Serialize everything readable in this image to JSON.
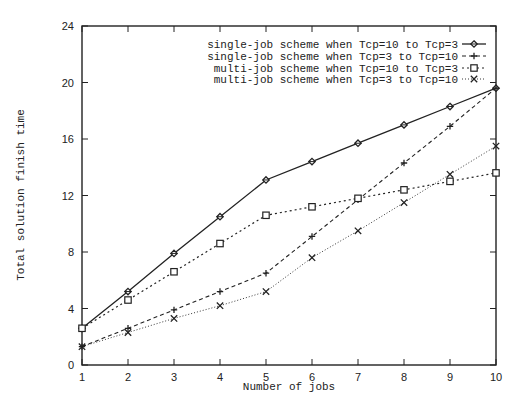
{
  "chart_data": {
    "type": "line",
    "title": "",
    "xlabel": "Number of jobs",
    "ylabel": "Total solution finish time",
    "x": [
      1,
      2,
      3,
      4,
      5,
      6,
      7,
      8,
      9,
      10
    ],
    "xlim": [
      1,
      10
    ],
    "ylim": [
      0,
      24
    ],
    "xticks": [
      "1",
      "2",
      "3",
      "4",
      "5",
      "6",
      "7",
      "8",
      "9",
      "10"
    ],
    "yticks": [
      "0",
      "4",
      "8",
      "12",
      "16",
      "20",
      "24"
    ],
    "grid": false,
    "legend_position": "upper right",
    "series": [
      {
        "name": "single-job scheme when Tcp=10 to Tcp=3",
        "line_style": "solid",
        "marker": "diamond",
        "values": [
          2.6,
          5.2,
          7.9,
          10.5,
          13.1,
          14.4,
          15.7,
          17.0,
          18.3,
          19.6
        ]
      },
      {
        "name": "single-job scheme when Tcp=3 to Tcp=10",
        "line_style": "dashed",
        "marker": "plus",
        "values": [
          1.3,
          2.6,
          3.9,
          5.2,
          6.5,
          9.1,
          11.7,
          14.3,
          16.9,
          19.6
        ]
      },
      {
        "name": "multi-job scheme when Tcp=10 to Tcp=3",
        "line_style": "dotted",
        "marker": "square",
        "values": [
          2.6,
          4.6,
          6.6,
          8.6,
          10.6,
          11.2,
          11.8,
          12.4,
          13.0,
          13.6
        ]
      },
      {
        "name": "multi-job scheme when Tcp=3 to Tcp=10",
        "line_style": "fine-dotted",
        "marker": "cross",
        "values": [
          1.3,
          2.3,
          3.3,
          4.2,
          5.2,
          7.6,
          9.5,
          11.5,
          13.5,
          15.5
        ]
      }
    ]
  },
  "colors": {
    "line": "#222222",
    "background": "#ffffff"
  }
}
